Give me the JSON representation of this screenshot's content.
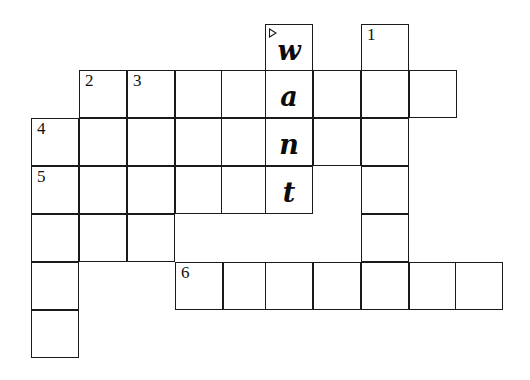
{
  "puzzle": {
    "kind": "crossword-grid",
    "title": "Crossword Puzzle Grid",
    "answer_shown": "want",
    "geometry": {
      "cell_size": 48,
      "origin_x": 31,
      "origin_y": 24,
      "columns_x": [
        31,
        79,
        127,
        175,
        223,
        265,
        313,
        361,
        409,
        455
      ],
      "rows_y": [
        24,
        70,
        118,
        166,
        214,
        262,
        310,
        358
      ],
      "border_color": "#1a1a1a",
      "cell_fill": "#ffffff",
      "page_background": "#ffffff"
    },
    "clue_numbers": [
      "1",
      "2",
      "3",
      "4",
      "5",
      "6"
    ],
    "cells": [
      {
        "name": "cell-r0c5-w",
        "x": 265,
        "y": 24,
        "number": "",
        "letter": "w",
        "marker": "start-arrow-right"
      },
      {
        "name": "cell-r0c7-n1",
        "x": 361,
        "y": 24,
        "number": "1",
        "letter": "",
        "marker": ""
      },
      {
        "name": "cell-r1c1-n2",
        "x": 79,
        "y": 70,
        "number": "2",
        "letter": "",
        "marker": ""
      },
      {
        "name": "cell-r1c2-n3",
        "x": 127,
        "y": 70,
        "number": "3",
        "letter": "",
        "marker": ""
      },
      {
        "name": "cell-r1c3",
        "x": 175,
        "y": 70,
        "number": "",
        "letter": "",
        "marker": ""
      },
      {
        "name": "cell-r1c4",
        "x": 221,
        "y": 70,
        "number": "",
        "letter": "",
        "marker": ""
      },
      {
        "name": "cell-r1c5-a",
        "x": 265,
        "y": 70,
        "number": "",
        "letter": "a",
        "marker": ""
      },
      {
        "name": "cell-r1c6",
        "x": 313,
        "y": 70,
        "number": "",
        "letter": "",
        "marker": ""
      },
      {
        "name": "cell-r1c7",
        "x": 361,
        "y": 70,
        "number": "",
        "letter": "",
        "marker": ""
      },
      {
        "name": "cell-r1c8",
        "x": 409,
        "y": 70,
        "number": "",
        "letter": "",
        "marker": ""
      },
      {
        "name": "cell-r2c0-n4",
        "x": 31,
        "y": 118,
        "number": "4",
        "letter": "",
        "marker": ""
      },
      {
        "name": "cell-r2c1",
        "x": 79,
        "y": 118,
        "number": "",
        "letter": "",
        "marker": ""
      },
      {
        "name": "cell-r2c2",
        "x": 127,
        "y": 118,
        "number": "",
        "letter": "",
        "marker": ""
      },
      {
        "name": "cell-r2c3",
        "x": 175,
        "y": 118,
        "number": "",
        "letter": "",
        "marker": ""
      },
      {
        "name": "cell-r2c4",
        "x": 221,
        "y": 118,
        "number": "",
        "letter": "",
        "marker": ""
      },
      {
        "name": "cell-r2c5-n",
        "x": 265,
        "y": 118,
        "number": "",
        "letter": "n",
        "marker": ""
      },
      {
        "name": "cell-r2c6",
        "x": 313,
        "y": 118,
        "number": "",
        "letter": "",
        "marker": ""
      },
      {
        "name": "cell-r2c7",
        "x": 361,
        "y": 118,
        "number": "",
        "letter": "",
        "marker": ""
      },
      {
        "name": "cell-r3c0-n5",
        "x": 31,
        "y": 166,
        "number": "5",
        "letter": "",
        "marker": ""
      },
      {
        "name": "cell-r3c1",
        "x": 79,
        "y": 166,
        "number": "",
        "letter": "",
        "marker": ""
      },
      {
        "name": "cell-r3c2",
        "x": 127,
        "y": 166,
        "number": "",
        "letter": "",
        "marker": ""
      },
      {
        "name": "cell-r3c3",
        "x": 175,
        "y": 166,
        "number": "",
        "letter": "",
        "marker": ""
      },
      {
        "name": "cell-r3c4",
        "x": 221,
        "y": 166,
        "number": "",
        "letter": "",
        "marker": ""
      },
      {
        "name": "cell-r3c5-t",
        "x": 265,
        "y": 166,
        "number": "",
        "letter": "t",
        "marker": ""
      },
      {
        "name": "cell-r3c7",
        "x": 361,
        "y": 166,
        "number": "",
        "letter": "",
        "marker": ""
      },
      {
        "name": "cell-r4c0",
        "x": 31,
        "y": 214,
        "number": "",
        "letter": "",
        "marker": ""
      },
      {
        "name": "cell-r4c1",
        "x": 79,
        "y": 214,
        "number": "",
        "letter": "",
        "marker": ""
      },
      {
        "name": "cell-r4c2",
        "x": 127,
        "y": 214,
        "number": "",
        "letter": "",
        "marker": ""
      },
      {
        "name": "cell-r4c7",
        "x": 361,
        "y": 214,
        "number": "",
        "letter": "",
        "marker": ""
      },
      {
        "name": "cell-r5c0",
        "x": 31,
        "y": 262,
        "number": "",
        "letter": "",
        "marker": ""
      },
      {
        "name": "cell-r5c3-n6",
        "x": 175,
        "y": 262,
        "number": "6",
        "letter": "",
        "marker": ""
      },
      {
        "name": "cell-r5c4",
        "x": 223,
        "y": 262,
        "number": "",
        "letter": "",
        "marker": ""
      },
      {
        "name": "cell-r5c5",
        "x": 265,
        "y": 262,
        "number": "",
        "letter": "",
        "marker": ""
      },
      {
        "name": "cell-r5c6",
        "x": 313,
        "y": 262,
        "number": "",
        "letter": "",
        "marker": ""
      },
      {
        "name": "cell-r5c7",
        "x": 361,
        "y": 262,
        "number": "",
        "letter": "",
        "marker": ""
      },
      {
        "name": "cell-r5c8",
        "x": 409,
        "y": 262,
        "number": "",
        "letter": "",
        "marker": ""
      },
      {
        "name": "cell-r5c9",
        "x": 455,
        "y": 262,
        "number": "",
        "letter": "",
        "marker": ""
      },
      {
        "name": "cell-r6c0",
        "x": 31,
        "y": 310,
        "number": "",
        "letter": "",
        "marker": ""
      }
    ]
  }
}
